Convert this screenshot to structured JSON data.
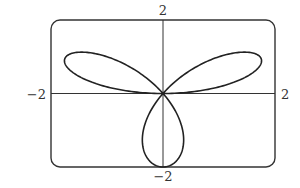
{
  "chart_data": {
    "type": "line",
    "title": "",
    "equation": "r = 2 sin(3θ)",
    "theta_range": [
      0,
      3.14159
    ],
    "xlim": [
      -2,
      2
    ],
    "ylim": [
      -2,
      2
    ],
    "xlabel": "",
    "ylabel": "",
    "tick_labels": {
      "x_min": "−2",
      "x_max": "2",
      "y_min": "−2",
      "y_max": "2"
    },
    "grid": false,
    "legend": null,
    "frame": "rounded rectangle",
    "series": [
      {
        "name": "rose",
        "color": "#222222",
        "samples": 360
      }
    ]
  },
  "layout": {
    "frame_left": 51,
    "frame_right": 275,
    "frame_top": 20,
    "frame_bottom": 167,
    "corner_radius": 9
  },
  "colors": {
    "curve": "#222222",
    "frame": "#333333",
    "axis": "#333333",
    "text": "#333333"
  }
}
